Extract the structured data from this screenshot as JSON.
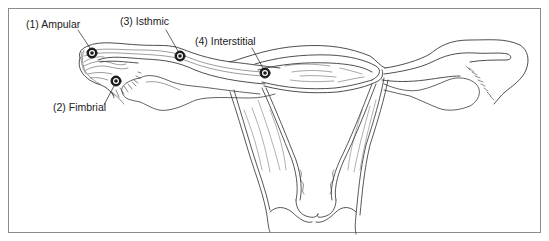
{
  "figure": {
    "labels": [
      {
        "id": "ampular",
        "text": "(1) Ampular"
      },
      {
        "id": "fimbrial",
        "text": "(2) Fimbrial"
      },
      {
        "id": "isthmic",
        "text": "(3) Isthmic"
      },
      {
        "id": "interstitial",
        "text": "(4) Interstitial"
      }
    ],
    "colors": {
      "line": "#3a3a3a",
      "frame": "#8c8c8c",
      "background": "#ffffff"
    }
  }
}
